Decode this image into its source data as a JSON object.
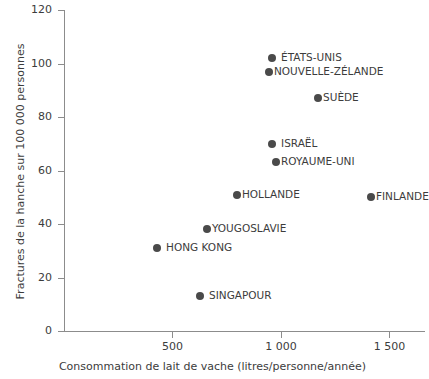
{
  "chart_data": {
    "type": "scatter",
    "title": "",
    "xlabel": "Consommation de lait de vache (litres/personne/année)",
    "ylabel": "Fractures de la hanche sur 100 000 personnes",
    "xlim": [
      0,
      1664
    ],
    "ylim": [
      0,
      120
    ],
    "xticks": [
      500,
      1000,
      1500
    ],
    "xticklabels": [
      "500",
      "1 000",
      "1 500"
    ],
    "yticks": [
      0,
      20,
      40,
      60,
      80,
      100,
      120
    ],
    "yticklabels": [
      "0",
      "20",
      "40",
      "60",
      "80",
      "100",
      "120"
    ],
    "grid": false,
    "legend": "none",
    "marker_color": "#4a4a4a",
    "axis_color": "#8c8c8c",
    "text_color": "#3c3c3c",
    "points": [
      {
        "label": "ÉTATS-UNIS",
        "x": 959,
        "y": 102
      },
      {
        "label": "NOUVELLE-ZÉLANDE",
        "x": 945,
        "y": 97
      },
      {
        "label": "SUÈDE",
        "x": 1171,
        "y": 87
      },
      {
        "label": "ISRAËL",
        "x": 959,
        "y": 70
      },
      {
        "label": "ROYAUME-UNI",
        "x": 977,
        "y": 63
      },
      {
        "label": "HOLLANDE",
        "x": 797,
        "y": 51
      },
      {
        "label": "FINLANDE",
        "x": 1415,
        "y": 50
      },
      {
        "label": "YOUGOSLAVIE",
        "x": 659,
        "y": 38
      },
      {
        "label": "HONG KONG",
        "x": 429,
        "y": 31
      },
      {
        "label": "SINGAPOUR",
        "x": 627,
        "y": 13
      }
    ]
  }
}
